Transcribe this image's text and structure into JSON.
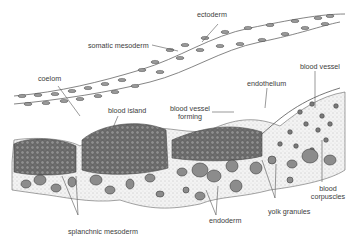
{
  "figure": {
    "type": "biological cross-section illustration",
    "colors": {
      "background": "#ffffff",
      "line": "#555555",
      "cell_fill": "#8a8a8a",
      "cell_dark": "#4a4a4a",
      "stipple": "#9a9a9a",
      "tissue_fill": "#ececec"
    },
    "labels": {
      "ectoderm": "ectoderm",
      "somatic_mesoderm": "somatic mesoderm",
      "coelom": "coelom",
      "blood_island": "blood island",
      "blood_vessel_forming_1": "blood vessel",
      "blood_vessel_forming_2": "forming",
      "endothelium": "endothelium",
      "blood_vessel": "blood vessel",
      "blood_corpuscles_1": "blood",
      "blood_corpuscles_2": "corpuscles",
      "yolk_granules": "yolk granules",
      "endoderm": "endoderm",
      "splanchnic_mesoderm": "splanchnic mesoderm"
    }
  }
}
